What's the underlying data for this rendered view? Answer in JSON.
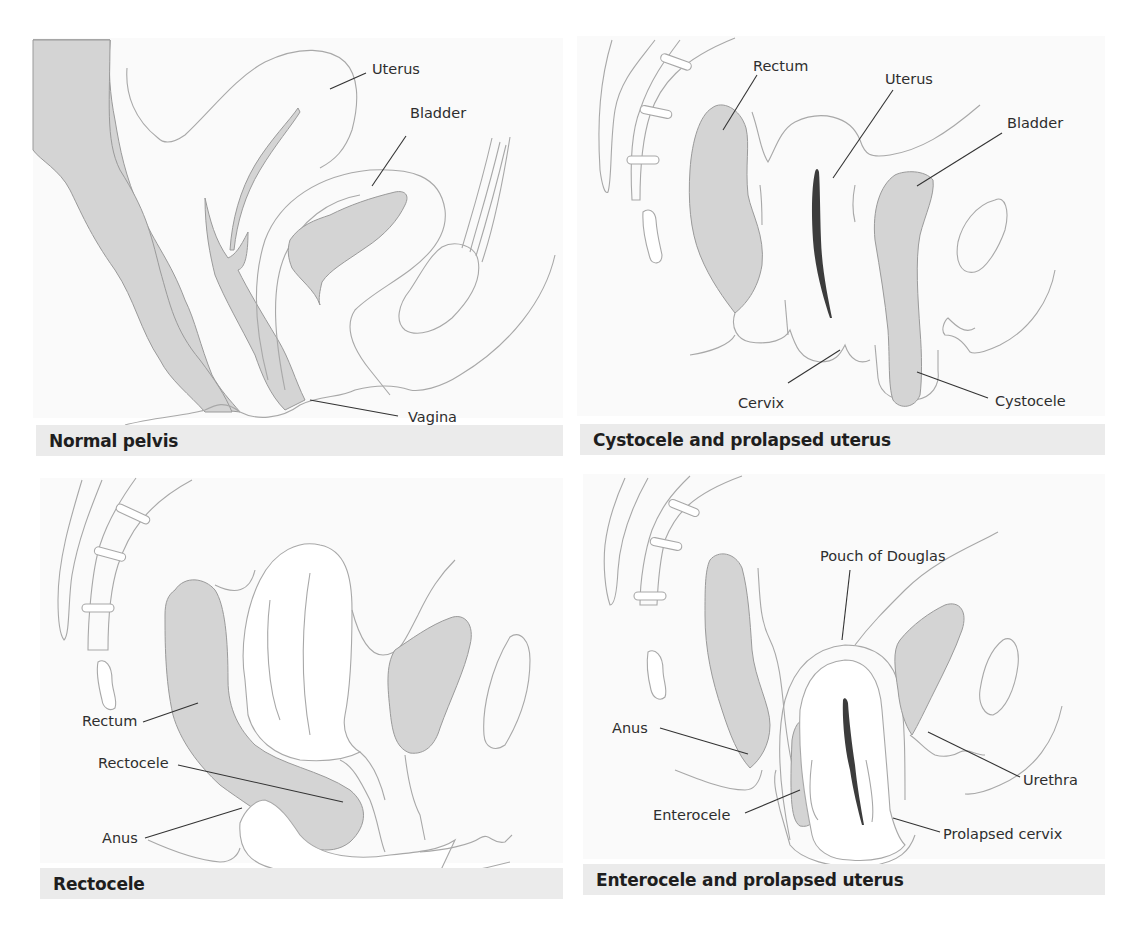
{
  "figure": {
    "colors": {
      "organ_fill": "#d4d4d4",
      "outline": "#a8a8a8",
      "leader_line": "#333333",
      "caption_bar": "#ebebeb",
      "caption_text": "#1e1e1e",
      "canal": "#3c3c3c"
    },
    "panels": [
      {
        "id": "normal-pelvis",
        "caption": "Normal pelvis",
        "labels": [
          "Uterus",
          "Bladder",
          "Vagina"
        ]
      },
      {
        "id": "cystocele-prolapsed-uterus",
        "caption": "Cystocele and prolapsed uterus",
        "labels": [
          "Rectum",
          "Uterus",
          "Bladder",
          "Cervix",
          "Cystocele"
        ]
      },
      {
        "id": "rectocele",
        "caption": "Rectocele",
        "labels": [
          "Rectum",
          "Rectocele",
          "Anus"
        ]
      },
      {
        "id": "enterocele-prolapsed-uterus",
        "caption": "Enterocele and prolapsed uterus",
        "labels": [
          "Pouch of Douglas",
          "Anus",
          "Urethra",
          "Enterocele",
          "Prolapsed cervix"
        ]
      }
    ]
  }
}
